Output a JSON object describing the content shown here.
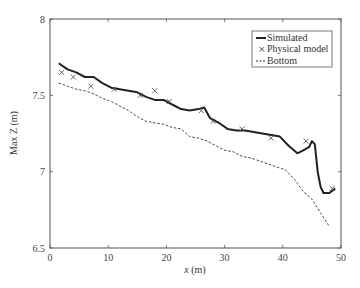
{
  "chart_data": {
    "type": "line",
    "title": "",
    "xlabel": "x (m)",
    "ylabel": "Max Z (m)",
    "xlim": [
      0,
      50
    ],
    "ylim": [
      6.5,
      8
    ],
    "x_ticks": [
      0,
      10,
      20,
      30,
      40,
      50
    ],
    "y_ticks": [
      6.5,
      7,
      7.5,
      8
    ],
    "y_tick_labels": [
      "6.5",
      "7",
      "7.5",
      "8"
    ],
    "grid": false,
    "legend_position": "upper right",
    "legend": [
      "Simulated",
      "Physical model",
      "Bottom"
    ],
    "series": [
      {
        "name": "Simulated",
        "style": "solid-thick",
        "color": "#222222",
        "x": [
          1.5,
          3,
          4.5,
          6,
          7.5,
          9,
          10.5,
          12,
          13.5,
          15,
          16.5,
          18,
          19.5,
          21,
          22.5,
          24,
          25.5,
          26.5,
          27.5,
          29,
          30.5,
          32,
          33.5,
          35,
          36.5,
          38,
          39.5,
          41,
          42.5,
          43.5,
          44.5,
          45,
          45.5,
          46,
          46.5,
          47,
          48,
          49
        ],
        "y": [
          7.71,
          7.67,
          7.65,
          7.62,
          7.62,
          7.58,
          7.55,
          7.54,
          7.53,
          7.52,
          7.49,
          7.47,
          7.47,
          7.44,
          7.41,
          7.4,
          7.41,
          7.42,
          7.35,
          7.32,
          7.28,
          7.27,
          7.27,
          7.26,
          7.25,
          7.24,
          7.23,
          7.17,
          7.12,
          7.14,
          7.16,
          7.2,
          7.18,
          7.0,
          6.9,
          6.86,
          6.86,
          6.89
        ]
      },
      {
        "name": "Physical model",
        "style": "x-marker",
        "color": "#555555",
        "x": [
          2,
          4,
          7,
          11,
          15.5,
          18,
          20.5,
          26,
          28,
          33,
          38,
          44,
          48.5
        ],
        "y": [
          7.65,
          7.62,
          7.56,
          7.54,
          7.5,
          7.53,
          7.46,
          7.4,
          7.33,
          7.28,
          7.22,
          7.2,
          6.89
        ]
      },
      {
        "name": "Bottom",
        "style": "dashed",
        "color": "#333333",
        "x": [
          1.5,
          3,
          4.5,
          6,
          7.5,
          9,
          10.5,
          12,
          13.5,
          15,
          16.5,
          18,
          19.5,
          21,
          22.5,
          24,
          25.5,
          27,
          28.5,
          30,
          31.5,
          33,
          34.5,
          36,
          37.5,
          39,
          40.5,
          42,
          43.5,
          45,
          46.5,
          48
        ],
        "y": [
          7.58,
          7.56,
          7.54,
          7.53,
          7.51,
          7.48,
          7.46,
          7.43,
          7.4,
          7.36,
          7.33,
          7.32,
          7.31,
          7.29,
          7.28,
          7.23,
          7.22,
          7.2,
          7.17,
          7.14,
          7.13,
          7.1,
          7.09,
          7.07,
          7.05,
          7.03,
          7.01,
          6.95,
          6.87,
          6.82,
          6.73,
          6.64
        ]
      }
    ]
  },
  "labels": {
    "xlabel_italic": "x",
    "xlabel_unit": " (m)",
    "ylabel": "Max Z (m)"
  }
}
